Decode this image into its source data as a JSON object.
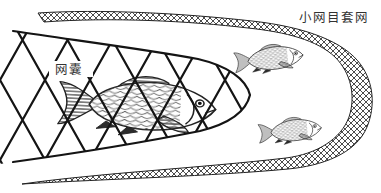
{
  "figure": {
    "labels": {
      "cover_net": "小网目套网",
      "cod_end": "网囊"
    },
    "colors": {
      "ink": "#1f1f1f",
      "background": "#ffffff"
    },
    "fish": {
      "inside_cod_end": 1,
      "between_nets": 2
    }
  }
}
